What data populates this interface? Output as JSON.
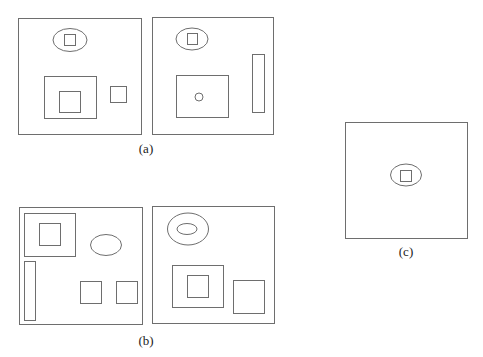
{
  "figure": {
    "stroke_color": "#6e6e6e",
    "background": "#ffffff",
    "labels": [
      {
        "id": "a",
        "text": "(a)",
        "x": 146,
        "y": 149
      },
      {
        "id": "b",
        "text": "(b)",
        "x": 146,
        "y": 341
      },
      {
        "id": "c",
        "text": "(c)",
        "x": 406,
        "y": 252
      }
    ],
    "panels": [
      {
        "name": "panel-a-left",
        "group": "a",
        "frame": {
          "x": 18,
          "y": 18,
          "w": 123,
          "h": 116
        },
        "shapes": [
          {
            "type": "ellipse",
            "name": "ellipse",
            "cx": 70,
            "cy": 40,
            "rx": 17,
            "ry": 11.5
          },
          {
            "type": "rect",
            "name": "square-in-ellipse",
            "x": 64,
            "y": 34,
            "w": 11,
            "h": 11
          },
          {
            "type": "rect",
            "name": "large-square",
            "x": 44,
            "y": 76,
            "w": 52,
            "h": 42
          },
          {
            "type": "rect",
            "name": "inner-square",
            "x": 59,
            "y": 91,
            "w": 21,
            "h": 21
          },
          {
            "type": "rect",
            "name": "small-square-right",
            "x": 110,
            "y": 86,
            "w": 16,
            "h": 16
          }
        ]
      },
      {
        "name": "panel-a-right",
        "group": "a",
        "frame": {
          "x": 152,
          "y": 17,
          "w": 121,
          "h": 117
        },
        "shapes": [
          {
            "type": "ellipse",
            "name": "ellipse",
            "cx": 192,
            "cy": 39,
            "rx": 16,
            "ry": 11
          },
          {
            "type": "rect",
            "name": "square-in-ellipse",
            "x": 187,
            "y": 33,
            "w": 10,
            "h": 11
          },
          {
            "type": "rect",
            "name": "large-rect",
            "x": 176,
            "y": 75,
            "w": 52,
            "h": 42
          },
          {
            "type": "circle",
            "name": "small-circle",
            "cx": 199,
            "cy": 97,
            "r": 4
          },
          {
            "type": "rect",
            "name": "tall-rect",
            "x": 252,
            "y": 54,
            "w": 12,
            "h": 58
          }
        ]
      },
      {
        "name": "panel-b-left",
        "group": "b",
        "frame": {
          "x": 19,
          "y": 207,
          "w": 123,
          "h": 117
        },
        "shapes": [
          {
            "type": "rect",
            "name": "top-left-rect",
            "x": 24,
            "y": 213,
            "w": 51,
            "h": 43
          },
          {
            "type": "rect",
            "name": "inner-square",
            "x": 39,
            "y": 223,
            "w": 21,
            "h": 22
          },
          {
            "type": "ellipse",
            "name": "ellipse",
            "cx": 106,
            "cy": 245,
            "rx": 15.5,
            "ry": 10.5
          },
          {
            "type": "rect",
            "name": "tall-rect",
            "x": 24,
            "y": 261,
            "w": 11,
            "h": 59
          },
          {
            "type": "rect",
            "name": "square-1",
            "x": 80,
            "y": 281,
            "w": 21,
            "h": 22
          },
          {
            "type": "rect",
            "name": "square-2",
            "x": 116,
            "y": 281,
            "w": 21,
            "h": 22
          }
        ]
      },
      {
        "name": "panel-b-right",
        "group": "b",
        "frame": {
          "x": 152,
          "y": 206,
          "w": 122,
          "h": 117
        },
        "shapes": [
          {
            "type": "ellipse",
            "name": "outer-ellipse",
            "cx": 188,
            "cy": 229,
            "rx": 20.5,
            "ry": 16
          },
          {
            "type": "ellipse",
            "name": "inner-ellipse",
            "cx": 187,
            "cy": 229,
            "rx": 10,
            "ry": 5.5
          },
          {
            "type": "rect",
            "name": "large-rect",
            "x": 172,
            "y": 265,
            "w": 51,
            "h": 42
          },
          {
            "type": "rect",
            "name": "inner-square",
            "x": 187,
            "y": 275,
            "w": 21,
            "h": 22
          },
          {
            "type": "rect",
            "name": "right-square",
            "x": 233,
            "y": 280,
            "w": 31,
            "h": 33
          }
        ]
      },
      {
        "name": "panel-c",
        "group": "c",
        "frame": {
          "x": 345,
          "y": 122,
          "w": 122,
          "h": 116
        },
        "shapes": [
          {
            "type": "ellipse",
            "name": "ellipse",
            "cx": 406,
            "cy": 175,
            "rx": 15.5,
            "ry": 11
          },
          {
            "type": "rect",
            "name": "square-in-ellipse",
            "x": 400,
            "y": 170,
            "w": 11,
            "h": 11
          }
        ]
      }
    ]
  }
}
